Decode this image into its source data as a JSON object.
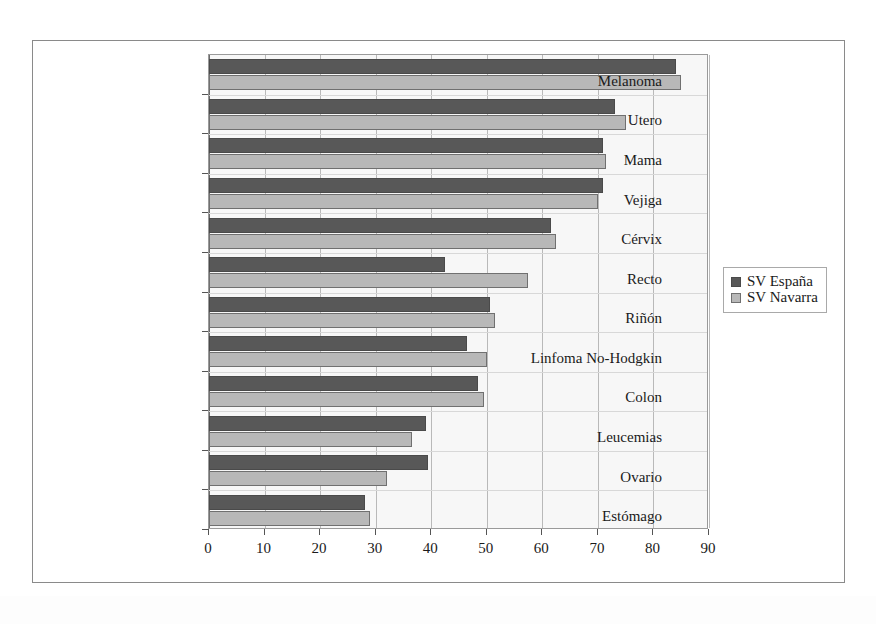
{
  "chart_data": {
    "type": "bar",
    "orientation": "horizontal",
    "title": "",
    "xlabel": "",
    "ylabel": "",
    "xlim": [
      0,
      90
    ],
    "xticks": [
      0,
      10,
      20,
      30,
      40,
      50,
      60,
      70,
      80,
      90
    ],
    "grid": true,
    "legend_position": "right",
    "categories": [
      "Melanoma",
      "Utero",
      "Mama",
      "Vejiga",
      "Cérvix",
      "Recto",
      "Riñón",
      "Linfoma No-Hodgkin",
      "Colon",
      "Leucemias",
      "Ovario",
      "Estómago"
    ],
    "series": [
      {
        "name": "SV España",
        "color": "#585858",
        "values": [
          84,
          73,
          71,
          71,
          61.5,
          42.5,
          50.5,
          46.5,
          48.5,
          39,
          39.5,
          28
        ]
      },
      {
        "name": "SV Navarra",
        "color": "#b8b8b8",
        "values": [
          85,
          75,
          71.5,
          70,
          62.5,
          57.5,
          51.5,
          50,
          49.5,
          36.5,
          32,
          29
        ]
      }
    ]
  },
  "legend": {
    "items": [
      {
        "label": "SV España",
        "color": "#585858"
      },
      {
        "label": "SV Navarra",
        "color": "#b8b8b8"
      }
    ]
  },
  "colors": {
    "series_dark": "#585858",
    "series_light": "#b8b8b8",
    "plot_background": "#f7f7f7",
    "gridline": "#b9b9b9",
    "frame": "#8a8a8a",
    "text": "#1a1a1a"
  }
}
